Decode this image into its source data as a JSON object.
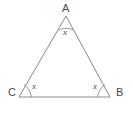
{
  "figure": {
    "type": "geometry-diagram",
    "shape": "triangle",
    "background_color": "#ffffff",
    "stroke_color": "#8a8a8a",
    "text_color": "#4a4a4a",
    "vertices": [
      {
        "id": "A",
        "label": "A",
        "x": 66,
        "y": 16,
        "label_x": 62,
        "label_y": 3
      },
      {
        "id": "C",
        "label": "C",
        "x": 19,
        "y": 97,
        "label_x": 8,
        "label_y": 87
      },
      {
        "id": "B",
        "label": "B",
        "x": 110,
        "y": 97,
        "label_x": 116,
        "label_y": 87
      }
    ],
    "sides": [
      {
        "from": "C",
        "to": "A"
      },
      {
        "from": "A",
        "to": "B"
      },
      {
        "from": "C",
        "to": "B"
      }
    ],
    "angle_marks": [
      {
        "vertex": "A",
        "label": "x",
        "label_x": 63,
        "label_y": 28
      },
      {
        "vertex": "C",
        "label": "x",
        "label_x": 32,
        "label_y": 82
      },
      {
        "vertex": "B",
        "label": "x",
        "label_x": 93,
        "label_y": 82
      }
    ],
    "triangle_path": "M 66 16 L 19 97 L 110 97 Z",
    "arc_apex_path": "M 58.5 30 Q 66 26.5 73.5 30",
    "arc_left_path": "M 31.5 97 Q 29.5 88 24 84.5",
    "arc_right_path": "M 97.5 97 Q 99.5 88 105 84.5"
  }
}
